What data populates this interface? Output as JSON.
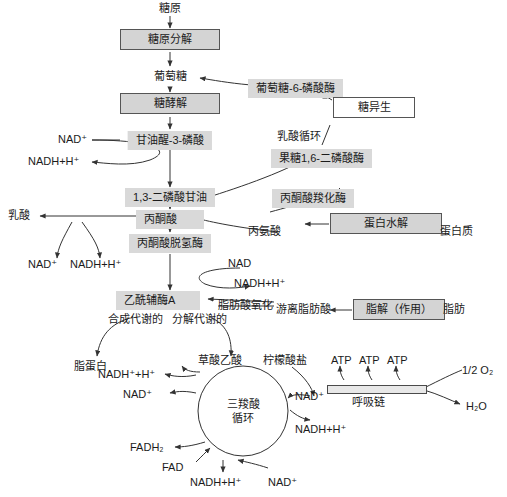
{
  "diagram": {
    "type": "metabolic-pathway",
    "colors": {
      "box_fill_grey": "#d4d4d4",
      "box_fill_white": "#ffffff",
      "label_fill": "#d9d9d9",
      "border": "#555555",
      "stroke": "#333333",
      "text": "#1b1b1b",
      "background": "#ffffff"
    }
  },
  "nodes": {
    "glycogen": "糖原",
    "glycogenolysis": "糖原分解",
    "glucose": "葡萄糖",
    "glycolysis": "糖酵解",
    "glucose_6_phosphatase": "葡萄糖-6-磷酸酶",
    "gluconeogenesis": "糖异生",
    "cori_cycle": "乳酸循环",
    "fructose_1_6_bisphosphatase": "果糖1,6-二磷酸酶",
    "glyceraldehyde_3_phosphate": "甘油醒-3-磷酸",
    "bisphosphoglycerate": "1,3-二磷酸甘油",
    "pyruvate": "丙酮酸",
    "lactate": "乳酸",
    "pyruvate_carboxylase": "丙酮酸羧化酶",
    "pyruvate_dehydrogenase": "丙酮酸脱氢酶",
    "alanine": "丙氨酸",
    "proteolysis": "蛋白水解",
    "protein": "蛋白质",
    "acetyl_coa": "乙酰辅酶A",
    "fatty_acid_oxidation": "脂肪酸氧化",
    "free_fatty_acid": "游离脂肪酸",
    "lipolysis": "脂解（作用）",
    "fat": "脂肪",
    "anabolic": "合成代谢的",
    "catabolic": "分解代谢的",
    "lipoprotein": "脂蛋白",
    "oxaloacetate": "草酸乙酸",
    "citrate": "柠檬酸盐",
    "tca_cycle_line1": "三羧酸",
    "tca_cycle_line2": "循环",
    "respiratory_chain": "呼吸链",
    "half_oxygen": "1/2 O₂",
    "water": "H₂O",
    "atp": "ATP"
  },
  "cofactors": {
    "nad_plus": "NAD⁺",
    "nad": "NAD",
    "nadh_h": "NADH+H⁺",
    "nadh_plus_h": "NADH⁺+H⁺",
    "fad": "FAD",
    "fadh2": "FADH₂"
  },
  "instances": {
    "glycolysis_nad_plus": "NAD⁺",
    "glycolysis_nadh": "NADH+H⁺",
    "lactate_nad_plus": "NAD⁺",
    "lactate_nadh": "NADH+H⁺",
    "pdh_nad": "NAD",
    "pdh_nadh": "NADH+H⁺",
    "tca_left_nadh": "NADH⁺+H⁺",
    "tca_left_nad": "NAD⁺",
    "tca_right_nad": "NAD⁺",
    "tca_right_nadh": "NADH+H⁺",
    "tca_fadh2": "FADH₂",
    "tca_fad": "FAD",
    "tca_bottom_nadh": "NADH+H⁺",
    "tca_bottom_nad": "NAD⁺",
    "atp_1": "ATP",
    "atp_2": "ATP",
    "atp_3": "ATP"
  }
}
